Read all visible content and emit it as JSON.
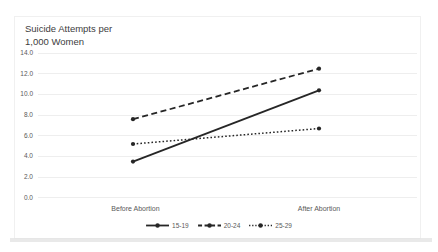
{
  "chart_data": {
    "type": "line",
    "title": "Suicide Attempts per 1,000 Women",
    "categories": [
      "Before Abortion",
      "After Abortion"
    ],
    "series": [
      {
        "name": "15-19",
        "line_style": "solid",
        "values": [
          3.5,
          10.4
        ]
      },
      {
        "name": "20-24",
        "line_style": "dashed",
        "values": [
          7.6,
          12.5
        ]
      },
      {
        "name": "25-29",
        "line_style": "dotted",
        "values": [
          5.2,
          6.7
        ]
      }
    ],
    "xlabel": "",
    "ylabel": "",
    "ylim": [
      0,
      14
    ],
    "y_tick_interval": 2,
    "y_tick_labels": [
      "0.0",
      "2.0",
      "4.0",
      "6.0",
      "8.0",
      "10.0",
      "12.0",
      "14.0"
    ],
    "grid": "horizontal, very light gray",
    "legend_position": "bottom-center",
    "line_color": "#262626",
    "axis_text_color": "#595959",
    "gridline_color": "#eeeeee"
  }
}
